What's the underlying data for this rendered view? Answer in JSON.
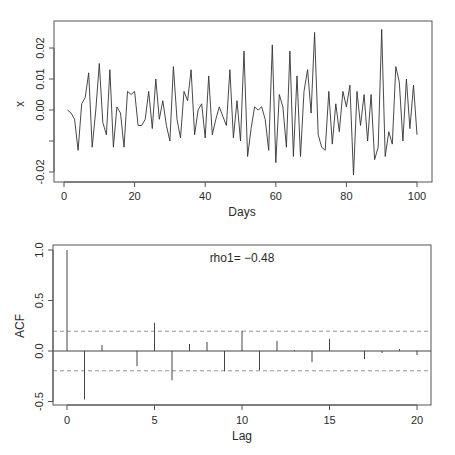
{
  "chart_data": [
    {
      "type": "line",
      "title": "",
      "xlabel": "Days",
      "ylabel": "x",
      "xlim": [
        0,
        100
      ],
      "ylim": [
        -0.022,
        0.028
      ],
      "xticks": [
        0,
        20,
        40,
        60,
        80,
        100
      ],
      "xtick_labels": [
        "0",
        "20",
        "40",
        "60",
        "80",
        "100"
      ],
      "yticks": [
        -0.02,
        -0.01,
        0.0,
        0.01,
        0.02
      ],
      "ytick_labels": [
        "-0.02",
        "",
        "0.00",
        "0.01",
        "0.02"
      ],
      "grid": false,
      "x": [
        1,
        2,
        3,
        4,
        5,
        6,
        7,
        8,
        9,
        10,
        11,
        12,
        13,
        14,
        15,
        16,
        17,
        18,
        19,
        20,
        21,
        22,
        23,
        24,
        25,
        26,
        27,
        28,
        29,
        30,
        31,
        32,
        33,
        34,
        35,
        36,
        37,
        38,
        39,
        40,
        41,
        42,
        43,
        44,
        45,
        46,
        47,
        48,
        49,
        50,
        51,
        52,
        53,
        54,
        55,
        56,
        57,
        58,
        59,
        60,
        61,
        62,
        63,
        64,
        65,
        66,
        67,
        68,
        69,
        70,
        71,
        72,
        73,
        74,
        75,
        76,
        77,
        78,
        79,
        80,
        81,
        82,
        83,
        84,
        85,
        86,
        87,
        88,
        89,
        90,
        91,
        92,
        93,
        94,
        95,
        96,
        97,
        98,
        99,
        100
      ],
      "values": [
        0.0,
        -0.001,
        -0.003,
        -0.013,
        0.002,
        0.004,
        0.012,
        -0.012,
        0.0,
        0.015,
        -0.004,
        -0.008,
        0.013,
        -0.012,
        0.001,
        -0.001,
        -0.012,
        0.006,
        0.005,
        0.006,
        -0.005,
        -0.005,
        -0.003,
        0.006,
        -0.006,
        0.01,
        -0.003,
        0.003,
        -0.005,
        -0.01,
        0.014,
        -0.003,
        -0.009,
        0.006,
        0.003,
        0.013,
        -0.008,
        0.0,
        0.002,
        -0.009,
        0.011,
        -0.008,
        -0.003,
        0.001,
        -0.002,
        -0.005,
        0.013,
        -0.009,
        0.003,
        -0.01,
        0.019,
        -0.015,
        -0.006,
        0.001,
        0.0,
        0.001,
        -0.003,
        -0.013,
        0.021,
        -0.017,
        0.005,
        0.001,
        -0.012,
        0.019,
        -0.015,
        0.011,
        -0.015,
        0.006,
        0.013,
        -0.001,
        0.025,
        -0.008,
        -0.012,
        -0.013,
        0.006,
        -0.011,
        0.002,
        -0.007,
        0.006,
        0.001,
        0.008,
        -0.021,
        0.006,
        -0.005,
        0.005,
        -0.01,
        0.005,
        -0.016,
        -0.012,
        0.026,
        -0.015,
        -0.007,
        -0.011,
        0.014,
        0.009,
        -0.01,
        0.01,
        -0.006,
        0.008,
        -0.008
      ]
    },
    {
      "type": "bar",
      "title": "",
      "xlabel": "Lag",
      "ylabel": "ACF",
      "xlim": [
        -0.8,
        20.8
      ],
      "ylim": [
        -0.54,
        1.05
      ],
      "xticks": [
        0,
        5,
        10,
        15,
        20
      ],
      "xtick_labels": [
        "0",
        "5",
        "10",
        "15",
        "20"
      ],
      "yticks": [
        -0.5,
        0.0,
        0.5,
        1.0
      ],
      "ytick_labels": [
        "-0.5",
        "0.0",
        "0.5",
        "1.0"
      ],
      "grid": false,
      "categories": [
        0,
        1,
        2,
        3,
        4,
        5,
        6,
        7,
        8,
        9,
        10,
        11,
        12,
        13,
        14,
        15,
        16,
        17,
        18,
        19,
        20
      ],
      "values": [
        1.0,
        -0.48,
        0.06,
        0.0,
        -0.15,
        0.28,
        -0.29,
        0.07,
        0.09,
        -0.2,
        0.2,
        -0.19,
        0.1,
        0.01,
        -0.11,
        0.12,
        0.0,
        -0.08,
        -0.02,
        0.02,
        -0.04
      ],
      "confidence_band": [
        -0.196,
        0.196
      ],
      "annotation": "rho1= −0.48"
    }
  ],
  "top_plot": {
    "xlabel": "Days",
    "ylabel": "x"
  },
  "bottom_plot": {
    "xlabel": "Lag",
    "ylabel": "ACF",
    "annotation": "rho1= −0.48"
  }
}
